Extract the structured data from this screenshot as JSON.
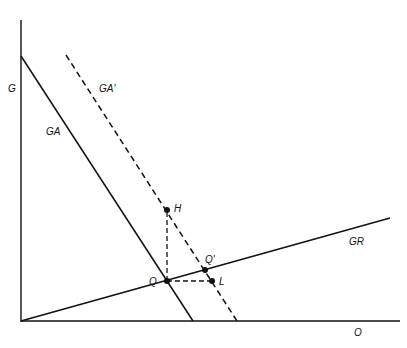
{
  "diagram": {
    "labels": {
      "y_axis": "G",
      "x_axis": "O",
      "curve_ga": "GA",
      "curve_ga_prime": "GA'",
      "curve_gr": "GR",
      "point_q": "Q",
      "point_q_prime": "Q'",
      "point_h": "H",
      "point_l": "L"
    },
    "colors": {
      "line": "#111111",
      "background": "#ffffff"
    }
  }
}
